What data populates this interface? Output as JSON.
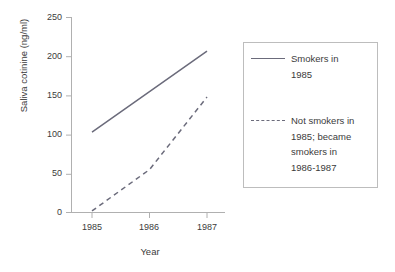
{
  "chart_data": {
    "type": "line",
    "title": "",
    "xlabel": "Year",
    "ylabel": "Saliva cotinine (ng/ml)",
    "x": [
      1985,
      1986,
      1987
    ],
    "xticklabels": [
      "1985",
      "1986",
      "1987"
    ],
    "yticklabels": [
      "0",
      "50",
      "100",
      "150",
      "200",
      "250"
    ],
    "yticks": [
      0,
      50,
      100,
      150,
      200,
      250
    ],
    "xlim": [
      1985,
      1987
    ],
    "ylim": [
      0,
      250
    ],
    "grid": false,
    "legend_position": "right-outside",
    "series": [
      {
        "name": "Smokers in 1985",
        "style": "solid",
        "color": "#6b6b7b",
        "values": [
          103,
          155,
          207
        ]
      },
      {
        "name": "Not smokers in 1985; became smokers in 1986-1987",
        "style": "dashed",
        "color": "#6b6b7b",
        "values": [
          2,
          55,
          148
        ]
      }
    ]
  },
  "axis": {
    "ylabel": "Saliva cotinine (ng/ml)",
    "xlabel": "Year",
    "yticks": [
      "250",
      "200",
      "150",
      "100",
      "50",
      "0"
    ],
    "xticks": [
      "1985",
      "1986",
      "1987"
    ]
  },
  "legend": {
    "entries": [
      {
        "style": "solid",
        "lines": [
          "Smokers in",
          "1985"
        ]
      },
      {
        "style": "dashed",
        "lines": [
          "Not smokers in",
          "1985; became",
          "smokers in",
          "1986-1987"
        ]
      }
    ]
  },
  "colors": {
    "line": "#6b6b7b",
    "axis": "#b0b0b0",
    "text": "#3b3b3b",
    "legend_border": "#bdbdbd"
  }
}
